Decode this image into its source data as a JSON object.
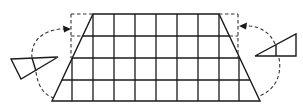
{
  "diagram": {
    "colors": {
      "stroke": "#1a1a1a",
      "dashed": "#333333",
      "background": "#ffffff"
    },
    "grid": {
      "columns_x": [
        72,
        93,
        114,
        135,
        156,
        177,
        198,
        219,
        239
      ],
      "rows_y": [
        14,
        36,
        58,
        80,
        101
      ],
      "trapezoid": {
        "top_left": [
          93,
          14
        ],
        "top_right": [
          219,
          14
        ],
        "bottom_right": [
          260,
          101
        ],
        "bottom_left": [
          52,
          101
        ]
      },
      "dashed_rectangle": {
        "left_x": 71,
        "right_x": 238,
        "top_y": 14
      }
    },
    "left_triangle": {
      "vertices": [
        [
          11,
          59
        ],
        [
          58,
          57
        ],
        [
          21,
          79
        ]
      ],
      "inner_line": [
        [
          32,
          58
        ],
        [
          36,
          71
        ]
      ]
    },
    "right_triangle": {
      "vertices": [
        [
          255,
          56
        ],
        [
          296,
          34
        ],
        [
          296,
          56
        ]
      ],
      "inner_line": [
        [
          276,
          45
        ],
        [
          276,
          56
        ]
      ]
    },
    "arrows": [
      {
        "name": "left-rotation-arrow",
        "direction": "to dashed left corner"
      },
      {
        "name": "right-rotation-arrow",
        "direction": "to dashed right corner"
      }
    ]
  }
}
